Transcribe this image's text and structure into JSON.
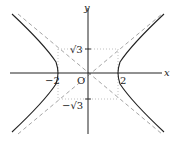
{
  "diagram": {
    "type": "hyperbola",
    "equation": "x^2/4 - y^2/3 = 1",
    "labels": {
      "x_axis": "x",
      "y_axis": "y",
      "origin": "O",
      "vertex_neg": "−2",
      "vertex_pos": "2",
      "b_pos": "√3",
      "b_neg": "−√3"
    },
    "asymptotes": [
      "y = (√3/2)x",
      "y = −(√3/2)x"
    ],
    "colors": {
      "curve": "#222222",
      "axis": "#222222",
      "asymptote": "#9a9a9a",
      "guide_box": "#b0b0b0"
    }
  }
}
